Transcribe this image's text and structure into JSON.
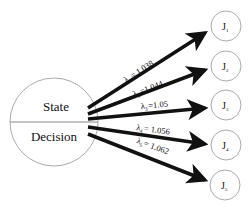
{
  "source_node": {
    "top_label": "State",
    "bottom_label": "Decision"
  },
  "edges": [
    {
      "symbol": "λ",
      "sub": "1",
      "value": "= 1.038"
    },
    {
      "symbol": "λ",
      "sub": "2",
      "value": "=1.044"
    },
    {
      "symbol": "λ",
      "sub": "3",
      "value": "=1.05"
    },
    {
      "symbol": "λ",
      "sub": "4",
      "value": "= 1.056"
    },
    {
      "symbol": "λ",
      "sub": "5",
      "value": "= 1.062"
    }
  ],
  "targets": [
    {
      "label": "J",
      "sub": "1"
    },
    {
      "label": "J",
      "sub": "2"
    },
    {
      "label": "J",
      "sub": "3"
    },
    {
      "label": "J",
      "sub": "4"
    },
    {
      "label": "J",
      "sub": "5"
    }
  ]
}
